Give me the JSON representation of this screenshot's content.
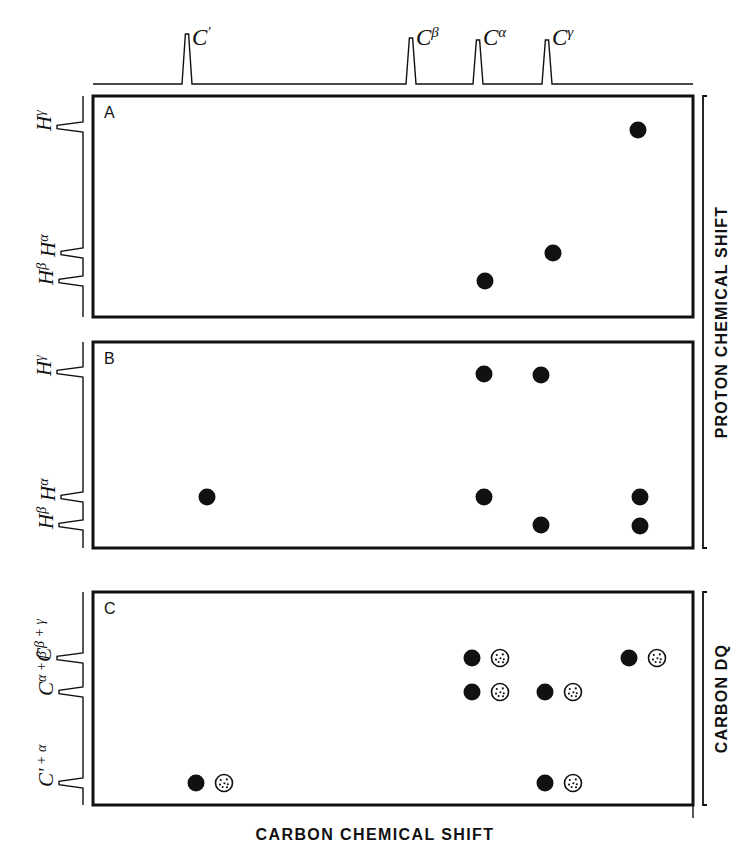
{
  "figure": {
    "width": 751,
    "height": 864,
    "background": "#ffffff",
    "ink": "#111111"
  },
  "axes": {
    "x_label": "CARBON CHEMICAL SHIFT",
    "y_label_top": "PROTON CHEMICAL SHIFT",
    "y_label_bottom": "CARBON DQ"
  },
  "panels": [
    {
      "id": "A",
      "letter": "A",
      "x": 93,
      "y": 96,
      "width": 600,
      "height": 221,
      "y_axis_kind": "proton",
      "y_trace_peaks": [
        {
          "label": "H",
          "sup": "γ",
          "y": 127,
          "height": 26
        },
        {
          "label": "H",
          "sup": "α",
          "y": 253,
          "height": 22
        },
        {
          "label": "H",
          "sup": "β",
          "y": 281,
          "height": 24
        }
      ],
      "points": [
        {
          "x": 638,
          "y": 130,
          "style": "filled",
          "cx_label": "Cγ",
          "cy_label": "Hγ"
        },
        {
          "x": 553,
          "y": 253,
          "style": "filled",
          "cx_label": "Cα",
          "cy_label": "Hα"
        },
        {
          "x": 485,
          "y": 281,
          "style": "filled",
          "cx_label": "Cβ",
          "cy_label": "Hβ"
        }
      ]
    },
    {
      "id": "B",
      "letter": "B",
      "x": 93,
      "y": 342,
      "width": 600,
      "height": 206,
      "y_axis_kind": "proton",
      "y_trace_peaks": [
        {
          "label": "H",
          "sup": "γ",
          "y": 372,
          "height": 26
        },
        {
          "label": "H",
          "sup": "α",
          "y": 497,
          "height": 22
        },
        {
          "label": "H",
          "sup": "β",
          "y": 525,
          "height": 24
        }
      ],
      "points": [
        {
          "x": 484,
          "y": 374,
          "style": "filled",
          "cx_label": "Cβ",
          "cy_label": "Hγ"
        },
        {
          "x": 541,
          "y": 375,
          "style": "filled",
          "cx_label": "Cα",
          "cy_label": "Hγ"
        },
        {
          "x": 207,
          "y": 497,
          "style": "filled",
          "cx_label": "C'",
          "cy_label": "Hα"
        },
        {
          "x": 484,
          "y": 497,
          "style": "filled",
          "cx_label": "Cβ",
          "cy_label": "Hα"
        },
        {
          "x": 640,
          "y": 497,
          "style": "filled",
          "cx_label": "Cγ",
          "cy_label": "Hα"
        },
        {
          "x": 541,
          "y": 525,
          "style": "filled",
          "cx_label": "Cα",
          "cy_label": "Hβ"
        },
        {
          "x": 640,
          "y": 526,
          "style": "filled",
          "cx_label": "Cγ",
          "cy_label": "Hβ"
        }
      ]
    },
    {
      "id": "C",
      "letter": "C",
      "x": 93,
      "y": 592,
      "width": 600,
      "height": 213,
      "y_axis_kind": "carbon_dq",
      "y_trace_peaks": [
        {
          "label": "C",
          "sup": "β + γ",
          "y": 658,
          "height": 26
        },
        {
          "label": "C",
          "sup": "α + β",
          "y": 692,
          "height": 24
        },
        {
          "label": "C'",
          "sup": " + α",
          "y": 783,
          "height": 24
        }
      ],
      "points": [
        {
          "x": 472,
          "y": 658,
          "style": "filled",
          "cx_label": "Cβ",
          "cy_label": "Cβ+γ"
        },
        {
          "x": 500,
          "y": 658,
          "style": "stippled",
          "cx_label": "Cβ",
          "cy_label": "Cβ+γ"
        },
        {
          "x": 629,
          "y": 658,
          "style": "filled",
          "cx_label": "Cγ",
          "cy_label": "Cβ+γ"
        },
        {
          "x": 657,
          "y": 658,
          "style": "stippled",
          "cx_label": "Cγ",
          "cy_label": "Cβ+γ"
        },
        {
          "x": 472,
          "y": 692,
          "style": "filled",
          "cx_label": "Cβ",
          "cy_label": "Cα+β"
        },
        {
          "x": 500,
          "y": 692,
          "style": "stippled",
          "cx_label": "Cβ",
          "cy_label": "Cα+β"
        },
        {
          "x": 545,
          "y": 692,
          "style": "filled",
          "cx_label": "Cα",
          "cy_label": "Cα+β"
        },
        {
          "x": 573,
          "y": 692,
          "style": "stippled",
          "cx_label": "Cα",
          "cy_label": "Cα+β"
        },
        {
          "x": 196,
          "y": 783,
          "style": "filled",
          "cx_label": "C'",
          "cy_label": "C'+α"
        },
        {
          "x": 224,
          "y": 783,
          "style": "stippled",
          "cx_label": "C'",
          "cy_label": "C'+α"
        },
        {
          "x": 545,
          "y": 783,
          "style": "filled",
          "cx_label": "Cα",
          "cy_label": "C'+α"
        },
        {
          "x": 573,
          "y": 783,
          "style": "stippled",
          "cx_label": "Cα",
          "cy_label": "C'+α"
        }
      ]
    }
  ],
  "top_trace": {
    "baseline_y": 84,
    "x_start": 93,
    "x_end": 693,
    "peaks": [
      {
        "label": "C",
        "sup": "′",
        "x": 187,
        "height": 50,
        "label_x": 192,
        "label_y": 27
      },
      {
        "label": "C",
        "sup": "β",
        "x": 411,
        "height": 46,
        "label_x": 416,
        "label_y": 27
      },
      {
        "label": "C",
        "sup": "α",
        "x": 478,
        "height": 44,
        "label_x": 483,
        "label_y": 27
      },
      {
        "label": "C",
        "sup": "γ",
        "x": 547,
        "height": 44,
        "label_x": 552,
        "label_y": 27
      }
    ]
  },
  "chart_data": {
    "type": "scatter",
    "title": "",
    "xlabel": "CARBON CHEMICAL SHIFT",
    "ylabel": "PROTON CHEMICAL SHIFT / CARBON DQ",
    "grid": false,
    "legend": "none",
    "carbon_resonances": [
      "C′",
      "Cβ",
      "Cα",
      "Cγ"
    ],
    "proton_resonances": [
      "Hγ",
      "Hα",
      "Hβ"
    ],
    "carbon_dq_resonances": [
      "Cβ + γ",
      "Cα + β",
      "C′ + α"
    ],
    "panels": [
      {
        "panel": "A",
        "y_axis": "PROTON CHEMICAL SHIFT",
        "cross_peaks": [
          {
            "carbon": "Cγ",
            "proton": "Hγ",
            "style": "filled"
          },
          {
            "carbon": "Cα",
            "proton": "Hα",
            "style": "filled"
          },
          {
            "carbon": "Cβ",
            "proton": "Hβ",
            "style": "filled"
          }
        ]
      },
      {
        "panel": "B",
        "y_axis": "PROTON CHEMICAL SHIFT",
        "cross_peaks": [
          {
            "carbon": "Cβ",
            "proton": "Hγ",
            "style": "filled"
          },
          {
            "carbon": "Cα",
            "proton": "Hγ",
            "style": "filled"
          },
          {
            "carbon": "C′",
            "proton": "Hα",
            "style": "filled"
          },
          {
            "carbon": "Cβ",
            "proton": "Hα",
            "style": "filled"
          },
          {
            "carbon": "Cγ",
            "proton": "Hα",
            "style": "filled"
          },
          {
            "carbon": "Cα",
            "proton": "Hβ",
            "style": "filled"
          },
          {
            "carbon": "Cγ",
            "proton": "Hβ",
            "style": "filled"
          }
        ]
      },
      {
        "panel": "C",
        "y_axis": "CARBON DQ",
        "cross_peaks": [
          {
            "carbon": "Cβ",
            "dq": "Cβ + γ",
            "style": "filled"
          },
          {
            "carbon": "Cβ",
            "dq": "Cβ + γ",
            "style": "stippled"
          },
          {
            "carbon": "Cγ",
            "dq": "Cβ + γ",
            "style": "filled"
          },
          {
            "carbon": "Cγ",
            "dq": "Cβ + γ",
            "style": "stippled"
          },
          {
            "carbon": "Cβ",
            "dq": "Cα + β",
            "style": "filled"
          },
          {
            "carbon": "Cβ",
            "dq": "Cα + β",
            "style": "stippled"
          },
          {
            "carbon": "Cα",
            "dq": "Cα + β",
            "style": "filled"
          },
          {
            "carbon": "Cα",
            "dq": "Cα + β",
            "style": "stippled"
          },
          {
            "carbon": "C′",
            "dq": "C′ + α",
            "style": "filled"
          },
          {
            "carbon": "C′",
            "dq": "C′ + α",
            "style": "stippled"
          },
          {
            "carbon": "Cα",
            "dq": "C′ + α",
            "style": "filled"
          },
          {
            "carbon": "Cα",
            "dq": "C′ + α",
            "style": "stippled"
          }
        ]
      }
    ]
  }
}
